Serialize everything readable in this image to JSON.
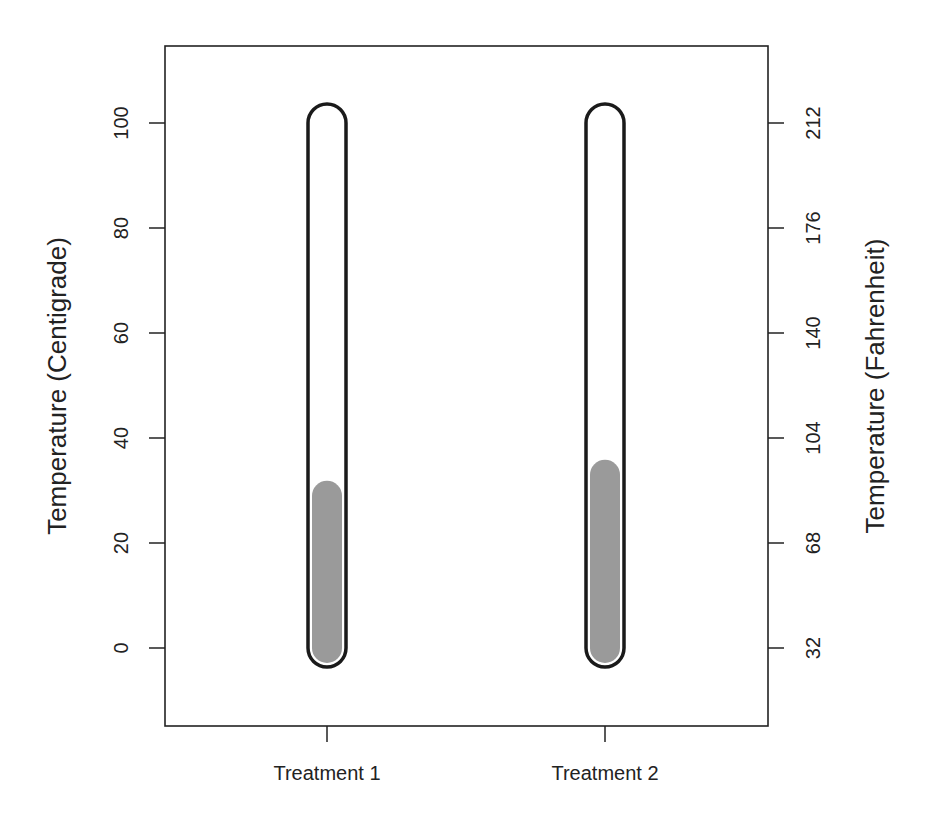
{
  "chart_data": {
    "type": "bar",
    "style": "thermometer",
    "title": "",
    "categories": [
      "Treatment 1",
      "Treatment 2"
    ],
    "values": [
      29,
      33
    ],
    "xlabel": "",
    "ylabel": "Temperature (Centigrade)",
    "ylabel_right": "Temperature (Fahrenheit)",
    "ylim": [
      -14,
      115
    ],
    "yticks": [
      0,
      20,
      40,
      60,
      80,
      100
    ],
    "yticks_right": [
      32,
      68,
      104,
      140,
      176,
      212
    ],
    "thermometer_range": [
      0,
      100
    ],
    "grid": false,
    "legend": null,
    "colors": {
      "fill": "#9a9a9a",
      "outline": "#1a1a1a",
      "frame": "#222222"
    }
  },
  "axis": {
    "left_label": "Temperature (Centigrade)",
    "right_label": "Temperature (Fahrenheit)",
    "left_ticks": [
      "0",
      "20",
      "40",
      "60",
      "80",
      "100"
    ],
    "right_ticks": [
      "32",
      "68",
      "104",
      "140",
      "176",
      "212"
    ],
    "x_ticks": [
      "Treatment 1",
      "Treatment 2"
    ]
  }
}
